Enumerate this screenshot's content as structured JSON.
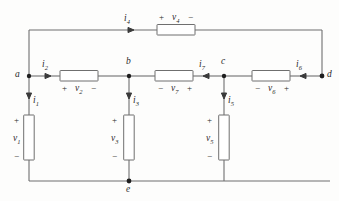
{
  "diagram": {
    "type": "electrical-circuit-schematic",
    "wire_color": "#6f6f6f",
    "text_color": "#2a2a2a",
    "background_color": "#fdfdfc"
  },
  "nodes": [
    {
      "id": "a",
      "label": "a",
      "x": 29,
      "y": 76
    },
    {
      "id": "b",
      "label": "b",
      "x": 129,
      "y": 76
    },
    {
      "id": "c",
      "label": "c",
      "x": 224,
      "y": 76
    },
    {
      "id": "d",
      "label": "d",
      "x": 322,
      "y": 76
    },
    {
      "id": "e",
      "label": "e",
      "x": 129,
      "y": 181
    }
  ],
  "elements": [
    {
      "id": "r4",
      "orientation": "horizontal",
      "voltage_label": "v",
      "voltage_sub": "4",
      "plus_side": "left",
      "minus_side": "right",
      "plus": "+",
      "minus": "−",
      "current_label": "i",
      "current_sub": "4",
      "current_direction": "right"
    },
    {
      "id": "r2",
      "orientation": "horizontal",
      "voltage_label": "v",
      "voltage_sub": "2",
      "plus_side": "left",
      "minus_side": "right",
      "plus": "+",
      "minus": "−",
      "current_label": "i",
      "current_sub": "2",
      "current_direction": "right"
    },
    {
      "id": "r7",
      "orientation": "horizontal",
      "voltage_label": "v",
      "voltage_sub": "7",
      "plus_side": "right",
      "minus_side": "left",
      "plus": "+",
      "minus": "−",
      "current_label": "i",
      "current_sub": "7",
      "current_direction": "left"
    },
    {
      "id": "r6",
      "orientation": "horizontal",
      "voltage_label": "v",
      "voltage_sub": "6",
      "plus_side": "right",
      "minus_side": "left",
      "plus": "+",
      "minus": "−",
      "current_label": "i",
      "current_sub": "6",
      "current_direction": "left"
    },
    {
      "id": "r1",
      "orientation": "vertical",
      "voltage_label": "v",
      "voltage_sub": "1",
      "plus_side": "top",
      "minus_side": "bottom",
      "plus": "+",
      "minus": "−",
      "current_label": "i",
      "current_sub": "1",
      "current_direction": "down"
    },
    {
      "id": "r3",
      "orientation": "vertical",
      "voltage_label": "v",
      "voltage_sub": "3",
      "plus_side": "top",
      "minus_side": "bottom",
      "plus": "+",
      "minus": "−",
      "current_label": "i",
      "current_sub": "3",
      "current_direction": "down"
    },
    {
      "id": "r5",
      "orientation": "vertical",
      "voltage_label": "v",
      "voltage_sub": "5",
      "plus_side": "top",
      "minus_side": "bottom",
      "plus": "+",
      "minus": "−",
      "current_label": "i",
      "current_sub": "5",
      "current_direction": "down"
    }
  ],
  "labels": {
    "i1": "i",
    "i1_sub": "1",
    "i2": "i",
    "i2_sub": "2",
    "i3": "i",
    "i3_sub": "3",
    "i4": "i",
    "i4_sub": "4",
    "i5": "i",
    "i5_sub": "5",
    "i6": "i",
    "i6_sub": "6",
    "i7": "i",
    "i7_sub": "7",
    "v1": "v",
    "v1_sub": "1",
    "v2": "v",
    "v2_sub": "2",
    "v3": "v",
    "v3_sub": "3",
    "v4": "v",
    "v4_sub": "4",
    "v5": "v",
    "v5_sub": "5",
    "v6": "v",
    "v6_sub": "6",
    "v7": "v",
    "v7_sub": "7",
    "node_a": "a",
    "node_b": "b",
    "node_c": "c",
    "node_d": "d",
    "node_e": "e",
    "plus": "+",
    "minus": "−"
  }
}
